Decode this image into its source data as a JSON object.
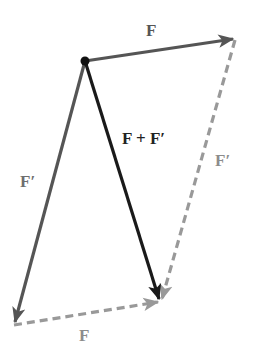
{
  "colors": {
    "background": "#ffffff",
    "vector_F": "#555555",
    "vector_F_prime": "#555555",
    "resultant": "#1a1a1a",
    "dashed_copy": "#999999",
    "origin_dot": "#111111",
    "label_dark": "#222222",
    "label_gray": "#8c8c8c"
  },
  "points": {
    "origin": [
      85,
      61
    ],
    "F_tip": [
      235,
      39
    ],
    "F_prime_tip": [
      14,
      325
    ],
    "sum_tip": [
      160,
      302
    ]
  },
  "vectors": [
    {
      "id": "F",
      "label": "F",
      "from": "origin",
      "to": "F_tip",
      "style": "solid"
    },
    {
      "id": "F_prime",
      "label": "F′",
      "from": "origin",
      "to": "F_prime_tip",
      "style": "solid"
    },
    {
      "id": "F_plus_F_prime",
      "label": "F + F′",
      "from": "origin",
      "to": "sum_tip",
      "style": "solid"
    },
    {
      "id": "F_prime_copy",
      "label": "F′",
      "from": "F_tip",
      "to": "sum_tip",
      "style": "dashed"
    },
    {
      "id": "F_copy",
      "label": "F",
      "from": "F_prime_tip",
      "to": "sum_tip",
      "style": "dashed"
    }
  ],
  "labels": {
    "F_top": "F",
    "F_prime_left": "F′",
    "sum": "F + F′",
    "F_prime_right": "F′",
    "F_bottom": "F"
  }
}
